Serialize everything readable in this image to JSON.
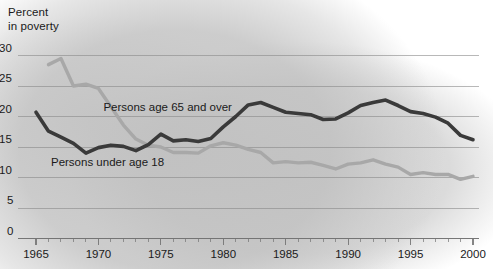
{
  "chart_data": {
    "type": "line",
    "title_lines": [
      "Percent",
      "in poverty"
    ],
    "xlabel": "",
    "ylabel": "Percent in poverty",
    "xlim": [
      1965,
      2000
    ],
    "ylim": [
      0,
      30
    ],
    "grid": true,
    "legend_position": "inline-annotations",
    "x_major_ticks": [
      1965,
      1970,
      1975,
      1980,
      1985,
      1990,
      1995,
      2000
    ],
    "x_tick_labels": [
      "1965",
      "1970",
      "1975",
      "1980",
      "1985",
      "1990",
      "1995",
      "2000"
    ],
    "x_minor_tick_interval": 1,
    "y_ticks": [
      0,
      5,
      10,
      15,
      20,
      25,
      30
    ],
    "y_tick_labels": [
      "0",
      "5",
      "10",
      "15",
      "20",
      "25",
      "30"
    ],
    "colors": {
      "under18": "#3a3a3a",
      "over65": "#a8a8a8",
      "gridline": "#8a8a8a",
      "axis": "#707070",
      "text": "#1a1a1a",
      "background": "#ffffff",
      "background_blob": "#c0c0c0"
    },
    "series": [
      {
        "name": "Persons age 65 and over",
        "color": "#a8a8a8",
        "label_x": 1970.4,
        "label_y": 21.4,
        "x": [
          1966,
          1967,
          1968,
          1969,
          1970,
          1971,
          1972,
          1973,
          1974,
          1975,
          1976,
          1977,
          1978,
          1979,
          1980,
          1981,
          1982,
          1983,
          1984,
          1985,
          1986,
          1987,
          1988,
          1989,
          1990,
          1991,
          1992,
          1993,
          1994,
          1995,
          1996,
          1997,
          1998,
          1999,
          2000
        ],
        "values": [
          28.5,
          29.5,
          25.0,
          25.3,
          24.6,
          21.6,
          18.6,
          16.3,
          15.3,
          15.0,
          14.1,
          14.1,
          14.0,
          15.2,
          15.7,
          15.3,
          14.6,
          14.1,
          12.4,
          12.6,
          12.4,
          12.5,
          12.0,
          11.4,
          12.2,
          12.4,
          12.9,
          12.2,
          11.7,
          10.5,
          10.8,
          10.5,
          10.5,
          9.7,
          10.2
        ]
      },
      {
        "name": "Persons under age 18",
        "color": "#3a3a3a",
        "label_x": 1966.2,
        "label_y": 12.3,
        "x": [
          1965,
          1966,
          1967,
          1968,
          1969,
          1970,
          1971,
          1972,
          1973,
          1974,
          1975,
          1976,
          1977,
          1978,
          1979,
          1980,
          1981,
          1982,
          1983,
          1984,
          1985,
          1986,
          1987,
          1988,
          1989,
          1990,
          1991,
          1992,
          1993,
          1994,
          1995,
          1996,
          1997,
          1998,
          1999,
          2000
        ],
        "values": [
          20.7,
          17.6,
          16.6,
          15.6,
          14.0,
          14.9,
          15.3,
          15.1,
          14.4,
          15.4,
          17.1,
          16.0,
          16.2,
          15.9,
          16.4,
          18.3,
          20.0,
          21.9,
          22.3,
          21.5,
          20.7,
          20.5,
          20.3,
          19.5,
          19.6,
          20.6,
          21.8,
          22.3,
          22.7,
          21.8,
          20.8,
          20.5,
          19.9,
          18.9,
          16.9,
          16.2
        ]
      }
    ]
  }
}
